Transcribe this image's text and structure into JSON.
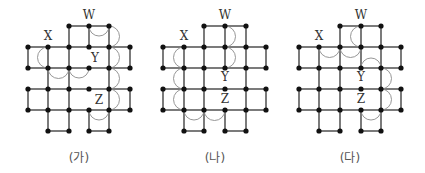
{
  "figures": [
    {
      "id": "ga",
      "caption": "(가)",
      "caption_x": 79,
      "cols": [
        28,
        48,
        69,
        89,
        109,
        130
      ],
      "rows": [
        26,
        47,
        68,
        89,
        110,
        131
      ],
      "nodes": [
        [
          2,
          0
        ],
        [
          3,
          0
        ],
        [
          4,
          0
        ],
        [
          0,
          1
        ],
        [
          1,
          1
        ],
        [
          2,
          1
        ],
        [
          3,
          1
        ],
        [
          4,
          1
        ],
        [
          5,
          1
        ],
        [
          0,
          2
        ],
        [
          1,
          2
        ],
        [
          2,
          2
        ],
        [
          3,
          2
        ],
        [
          4,
          2
        ],
        [
          5,
          2
        ],
        [
          0,
          3
        ],
        [
          1,
          3
        ],
        [
          2,
          3
        ],
        [
          3,
          3
        ],
        [
          4,
          3
        ],
        [
          5,
          3
        ],
        [
          0,
          4
        ],
        [
          1,
          4
        ],
        [
          2,
          4
        ],
        [
          3,
          4
        ],
        [
          4,
          4
        ],
        [
          5,
          4
        ],
        [
          1,
          5
        ],
        [
          2,
          5
        ],
        [
          3,
          5
        ],
        [
          4,
          5
        ]
      ],
      "hedges": [
        [
          0,
          2,
          3
        ],
        [
          0,
          3,
          4
        ],
        [
          1,
          0,
          1
        ],
        [
          1,
          1,
          2
        ],
        [
          1,
          2,
          3
        ],
        [
          1,
          3,
          4
        ],
        [
          1,
          4,
          5
        ],
        [
          2,
          0,
          1
        ],
        [
          2,
          1,
          2
        ],
        [
          2,
          2,
          3
        ],
        [
          2,
          3,
          4
        ],
        [
          2,
          4,
          5
        ],
        [
          3,
          0,
          1
        ],
        [
          3,
          1,
          2
        ],
        [
          3,
          2,
          3
        ],
        [
          3,
          3,
          4
        ],
        [
          3,
          4,
          5
        ],
        [
          4,
          0,
          1
        ],
        [
          4,
          1,
          2
        ],
        [
          4,
          2,
          3
        ],
        [
          4,
          3,
          4
        ],
        [
          4,
          4,
          5
        ],
        [
          5,
          1,
          2
        ],
        [
          5,
          3,
          4
        ]
      ],
      "vedges": [
        [
          2,
          0,
          1
        ],
        [
          3,
          0,
          1
        ],
        [
          4,
          0,
          1
        ],
        [
          0,
          1,
          2
        ],
        [
          1,
          1,
          2
        ],
        [
          2,
          1,
          2
        ],
        [
          4,
          1,
          2
        ],
        [
          5,
          1,
          2
        ],
        [
          1,
          2,
          3
        ],
        [
          2,
          2,
          3
        ],
        [
          4,
          2,
          3
        ],
        [
          0,
          3,
          4
        ],
        [
          1,
          3,
          4
        ],
        [
          2,
          3,
          4
        ],
        [
          4,
          3,
          4
        ],
        [
          5,
          3,
          4
        ],
        [
          1,
          4,
          5
        ],
        [
          2,
          4,
          5
        ],
        [
          3,
          4,
          5
        ],
        [
          4,
          4,
          5
        ]
      ],
      "arcs": [
        {
          "type": "h",
          "row": 0,
          "c1": 3,
          "c2": 4,
          "side": "below"
        },
        {
          "type": "v",
          "col": 4,
          "r1": 0,
          "r2": 1,
          "side": "right"
        },
        {
          "type": "v",
          "col": 1,
          "r1": 1,
          "r2": 2,
          "side": "left"
        },
        {
          "type": "h",
          "row": 2,
          "c1": 1,
          "c2": 2,
          "side": "below"
        },
        {
          "type": "h",
          "row": 2,
          "c1": 2,
          "c2": 3,
          "side": "below"
        },
        {
          "type": "v",
          "col": 4,
          "r1": 1,
          "r2": 2,
          "side": "right"
        },
        {
          "type": "v",
          "col": 4,
          "r1": 2,
          "r2": 3,
          "side": "right"
        },
        {
          "type": "v",
          "col": 4,
          "r1": 3,
          "r2": 4,
          "side": "right"
        },
        {
          "type": "h",
          "row": 4,
          "c1": 3,
          "c2": 4,
          "side": "below"
        }
      ],
      "labels": [
        {
          "text": "W",
          "col": 3,
          "row": 0,
          "dx": 0,
          "dy": -7
        },
        {
          "text": "X",
          "col": 1,
          "row": 1,
          "dx": 0,
          "dy": -7
        },
        {
          "text": "Y",
          "col": 3,
          "row": 2,
          "dx": 6,
          "dy": -6
        },
        {
          "text": "Z",
          "col": 4,
          "row": 4,
          "dx": -10,
          "dy": -6
        }
      ]
    },
    {
      "id": "na",
      "caption": "(나)",
      "caption_x": 215,
      "cols": [
        163,
        184,
        204,
        225,
        246,
        266
      ],
      "rows": [
        26,
        47,
        68,
        89,
        110,
        131
      ],
      "nodes": [
        [
          2,
          0
        ],
        [
          3,
          0
        ],
        [
          4,
          0
        ],
        [
          0,
          1
        ],
        [
          1,
          1
        ],
        [
          2,
          1
        ],
        [
          3,
          1
        ],
        [
          4,
          1
        ],
        [
          5,
          1
        ],
        [
          0,
          2
        ],
        [
          1,
          2
        ],
        [
          2,
          2
        ],
        [
          3,
          2
        ],
        [
          4,
          2
        ],
        [
          5,
          2
        ],
        [
          0,
          3
        ],
        [
          1,
          3
        ],
        [
          2,
          3
        ],
        [
          3,
          3
        ],
        [
          4,
          3
        ],
        [
          5,
          3
        ],
        [
          0,
          4
        ],
        [
          1,
          4
        ],
        [
          2,
          4
        ],
        [
          3,
          4
        ],
        [
          4,
          4
        ],
        [
          5,
          4
        ],
        [
          1,
          5
        ],
        [
          2,
          5
        ],
        [
          3,
          5
        ],
        [
          4,
          5
        ]
      ],
      "hedges": [
        [
          0,
          2,
          3
        ],
        [
          0,
          3,
          4
        ],
        [
          1,
          0,
          1
        ],
        [
          1,
          1,
          2
        ],
        [
          1,
          2,
          3
        ],
        [
          1,
          3,
          4
        ],
        [
          1,
          4,
          5
        ],
        [
          2,
          0,
          1
        ],
        [
          2,
          1,
          2
        ],
        [
          2,
          2,
          3
        ],
        [
          2,
          3,
          4
        ],
        [
          2,
          4,
          5
        ],
        [
          3,
          0,
          1
        ],
        [
          3,
          1,
          2
        ],
        [
          3,
          2,
          3
        ],
        [
          3,
          3,
          4
        ],
        [
          3,
          4,
          5
        ],
        [
          4,
          0,
          1
        ],
        [
          4,
          1,
          2
        ],
        [
          4,
          2,
          3
        ],
        [
          4,
          3,
          4
        ],
        [
          4,
          4,
          5
        ],
        [
          5,
          1,
          2
        ],
        [
          5,
          3,
          4
        ]
      ],
      "vedges": [
        [
          2,
          0,
          1
        ],
        [
          3,
          0,
          1
        ],
        [
          4,
          0,
          1
        ],
        [
          0,
          1,
          2
        ],
        [
          1,
          1,
          2
        ],
        [
          2,
          1,
          2
        ],
        [
          3,
          1,
          2
        ],
        [
          4,
          1,
          2
        ],
        [
          5,
          1,
          2
        ],
        [
          1,
          2,
          3
        ],
        [
          2,
          2,
          3
        ],
        [
          4,
          2,
          3
        ],
        [
          0,
          3,
          4
        ],
        [
          1,
          3,
          4
        ],
        [
          2,
          3,
          4
        ],
        [
          4,
          3,
          4
        ],
        [
          5,
          3,
          4
        ],
        [
          1,
          4,
          5
        ],
        [
          2,
          4,
          5
        ],
        [
          3,
          4,
          5
        ],
        [
          4,
          4,
          5
        ]
      ],
      "arcs": [
        {
          "type": "v",
          "col": 3,
          "r1": 0,
          "r2": 1,
          "side": "right"
        },
        {
          "type": "v",
          "col": 3,
          "r1": 1,
          "r2": 2,
          "side": "right"
        },
        {
          "type": "v",
          "col": 1,
          "r1": 1,
          "r2": 2,
          "side": "left"
        },
        {
          "type": "v",
          "col": 1,
          "r1": 2,
          "r2": 3,
          "side": "left"
        },
        {
          "type": "v",
          "col": 1,
          "r1": 3,
          "r2": 4,
          "side": "left"
        },
        {
          "type": "h",
          "row": 4,
          "c1": 1,
          "c2": 2,
          "side": "below"
        },
        {
          "type": "h",
          "row": 4,
          "c1": 2,
          "c2": 3,
          "side": "below"
        }
      ],
      "labels": [
        {
          "text": "W",
          "col": 3,
          "row": 0,
          "dx": 0,
          "dy": -7
        },
        {
          "text": "X",
          "col": 1,
          "row": 1,
          "dx": 0,
          "dy": -7
        },
        {
          "text": "Y",
          "col": 3,
          "row": 3,
          "dx": 0,
          "dy": -8
        },
        {
          "text": "Z",
          "col": 3,
          "row": 4,
          "dx": 0,
          "dy": -7
        }
      ]
    },
    {
      "id": "da",
      "caption": "(다)",
      "caption_x": 350,
      "cols": [
        299,
        319,
        340,
        361,
        381,
        401
      ],
      "rows": [
        26,
        47,
        68,
        89,
        110,
        131
      ],
      "nodes": [
        [
          2,
          0
        ],
        [
          3,
          0
        ],
        [
          4,
          0
        ],
        [
          0,
          1
        ],
        [
          1,
          1
        ],
        [
          2,
          1
        ],
        [
          3,
          1
        ],
        [
          4,
          1
        ],
        [
          5,
          1
        ],
        [
          0,
          2
        ],
        [
          1,
          2
        ],
        [
          2,
          2
        ],
        [
          3,
          2
        ],
        [
          4,
          2
        ],
        [
          5,
          2
        ],
        [
          0,
          3
        ],
        [
          1,
          3
        ],
        [
          2,
          3
        ],
        [
          3,
          3
        ],
        [
          4,
          3
        ],
        [
          5,
          3
        ],
        [
          0,
          4
        ],
        [
          1,
          4
        ],
        [
          2,
          4
        ],
        [
          3,
          4
        ],
        [
          4,
          4
        ],
        [
          5,
          4
        ],
        [
          1,
          5
        ],
        [
          2,
          5
        ],
        [
          3,
          5
        ],
        [
          4,
          5
        ]
      ],
      "hedges": [
        [
          0,
          2,
          3
        ],
        [
          0,
          3,
          4
        ],
        [
          1,
          0,
          1
        ],
        [
          1,
          1,
          2
        ],
        [
          1,
          2,
          3
        ],
        [
          1,
          3,
          4
        ],
        [
          1,
          4,
          5
        ],
        [
          2,
          0,
          1
        ],
        [
          2,
          1,
          2
        ],
        [
          2,
          2,
          3
        ],
        [
          2,
          3,
          4
        ],
        [
          2,
          4,
          5
        ],
        [
          3,
          0,
          1
        ],
        [
          3,
          1,
          2
        ],
        [
          3,
          2,
          3
        ],
        [
          3,
          3,
          4
        ],
        [
          3,
          4,
          5
        ],
        [
          4,
          0,
          1
        ],
        [
          4,
          1,
          2
        ],
        [
          4,
          2,
          3
        ],
        [
          4,
          3,
          4
        ],
        [
          4,
          4,
          5
        ],
        [
          5,
          1,
          2
        ],
        [
          5,
          3,
          4
        ]
      ],
      "vedges": [
        [
          2,
          0,
          1
        ],
        [
          3,
          0,
          1
        ],
        [
          4,
          0,
          1
        ],
        [
          0,
          1,
          2
        ],
        [
          1,
          1,
          2
        ],
        [
          2,
          1,
          2
        ],
        [
          3,
          1,
          2
        ],
        [
          4,
          1,
          2
        ],
        [
          5,
          1,
          2
        ],
        [
          1,
          2,
          3
        ],
        [
          2,
          2,
          3
        ],
        [
          4,
          2,
          3
        ],
        [
          0,
          3,
          4
        ],
        [
          1,
          3,
          4
        ],
        [
          2,
          3,
          4
        ],
        [
          4,
          3,
          4
        ],
        [
          5,
          3,
          4
        ],
        [
          1,
          4,
          5
        ],
        [
          2,
          4,
          5
        ],
        [
          3,
          4,
          5
        ],
        [
          4,
          4,
          5
        ]
      ],
      "arcs": [
        {
          "type": "v",
          "col": 3,
          "r1": 0,
          "r2": 1,
          "side": "left"
        },
        {
          "type": "h",
          "row": 1,
          "c1": 1,
          "c2": 2,
          "side": "below"
        },
        {
          "type": "h",
          "row": 1,
          "c1": 2,
          "c2": 3,
          "side": "below"
        },
        {
          "type": "h",
          "row": 2,
          "c1": 3,
          "c2": 4,
          "side": "above"
        },
        {
          "type": "v",
          "col": 4,
          "r1": 2,
          "r2": 3,
          "side": "right"
        },
        {
          "type": "v",
          "col": 4,
          "r1": 3,
          "r2": 4,
          "side": "right"
        },
        {
          "type": "h",
          "row": 4,
          "c1": 3,
          "c2": 4,
          "side": "below"
        }
      ],
      "labels": [
        {
          "text": "W",
          "col": 3,
          "row": 0,
          "dx": 0,
          "dy": -7
        },
        {
          "text": "X",
          "col": 1,
          "row": 1,
          "dx": 0,
          "dy": -7
        },
        {
          "text": "Y",
          "col": 3,
          "row": 3,
          "dx": 0,
          "dy": -8
        },
        {
          "text": "Z",
          "col": 3,
          "row": 4,
          "dx": 0,
          "dy": -7
        }
      ]
    }
  ]
}
